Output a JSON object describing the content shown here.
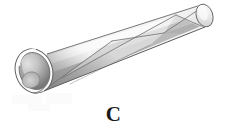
{
  "figure": {
    "label": "C",
    "object_name": "helically-wrapped-cylindrical-tube",
    "background_color": "#ffffff",
    "outline_color": "#5a5a5a"
  },
  "geometry": {
    "open_end": {
      "cx": 34,
      "cy": 71,
      "rx": 18,
      "ry": 22,
      "rotation_deg": -18
    },
    "closed_end": {
      "cx": 204,
      "cy": 15,
      "rx": 8,
      "ry": 11,
      "rotation_deg": -18
    },
    "axis_start": {
      "x": 34,
      "y": 71
    },
    "axis_end": {
      "x": 204,
      "y": 15
    },
    "top_edge": {
      "x1": 47,
      "y1": 54,
      "x2": 209,
      "y2": 6
    },
    "bottom_edge": {
      "x1": 44,
      "y1": 91,
      "x2": 201,
      "y2": 26
    }
  },
  "shading": {
    "highlight": "#e9e9e9",
    "midtone": "#b8b8b8",
    "shadow": "#8b8b8b",
    "deep_shadow": "#6e6e6e",
    "bore_light": "#d6d6d6",
    "bore_dark": "#7d7d7d",
    "rim": "#fdfdfd",
    "cap_light": "#f0f0f0"
  },
  "helix_seams": [
    {
      "id": "seam-1",
      "x1": 44,
      "y1": 90,
      "x2": 112,
      "y2": 41
    },
    {
      "id": "seam-2",
      "x1": 62,
      "y1": 78,
      "x2": 136,
      "y2": 37
    },
    {
      "id": "seam-3",
      "x1": 112,
      "y1": 41,
      "x2": 164,
      "y2": 33
    },
    {
      "id": "seam-4",
      "x1": 136,
      "y1": 37,
      "x2": 176,
      "y2": 15
    },
    {
      "id": "seam-5",
      "x1": 164,
      "y1": 33,
      "x2": 196,
      "y2": 10
    },
    {
      "id": "seam-6",
      "x1": 176,
      "y1": 15,
      "x2": 200,
      "y2": 27
    }
  ],
  "artifacts": [
    {
      "id": "smudge-a",
      "x": 12,
      "y": 95,
      "w": 30,
      "h": 9
    },
    {
      "id": "smudge-b",
      "x": 46,
      "y": 93,
      "w": 26,
      "h": 11
    },
    {
      "id": "smudge-c",
      "x": 28,
      "y": 104,
      "w": 22,
      "h": 7
    }
  ]
}
